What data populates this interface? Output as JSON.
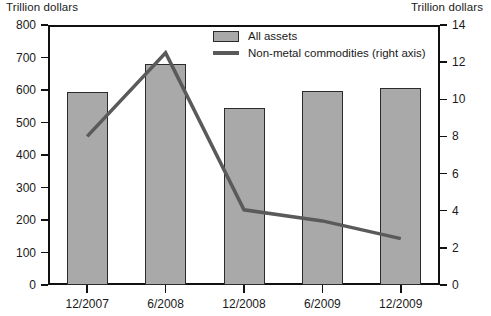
{
  "chart_data": {
    "type": "bar",
    "title": "",
    "subtitle": "",
    "categories": [
      "12/2007",
      "6/2008",
      "12/2008",
      "6/2009",
      "12/2009"
    ],
    "xlabel": "",
    "ylabel": "Trillion dollars",
    "ylabel_right": "Trillion dollars",
    "ylim": [
      0,
      800
    ],
    "ylim_right": [
      0,
      14
    ],
    "yticks": [
      0,
      100,
      200,
      300,
      400,
      500,
      600,
      700,
      800
    ],
    "yticks_right": [
      0,
      2,
      4,
      6,
      8,
      10,
      12,
      14
    ],
    "grid": false,
    "legend_position": "top-center",
    "series": [
      {
        "name": "All assets",
        "type": "bar",
        "axis": "left",
        "color": "#a9a9a9",
        "edge_color": "#2b2b2b",
        "values": [
          595,
          680,
          545,
          598,
          607
        ]
      },
      {
        "name": "Non-metal commodities (right axis)",
        "type": "line",
        "axis": "right",
        "color": "#5a5a5a",
        "values": [
          8.0,
          12.5,
          4.05,
          3.45,
          2.5
        ]
      }
    ]
  },
  "axis_captions": {
    "left": "Trillion dollars",
    "right": "Trillion dollars"
  },
  "legend": {
    "items": [
      {
        "label": "All assets",
        "marker": "filled-square-swatch"
      },
      {
        "label": "Non-metal commodities (right axis)",
        "marker": "line-swatch"
      }
    ]
  },
  "y_tick_labels_left": [
    "800",
    "700",
    "600",
    "500",
    "400",
    "300",
    "200",
    "100",
    "0"
  ],
  "y_tick_labels_right": [
    "14",
    "12",
    "10",
    "8",
    "6",
    "4",
    "2",
    "0"
  ],
  "x_tick_labels": [
    "12/2007",
    "6/2008",
    "12/2008",
    "6/2009",
    "12/2009"
  ],
  "colors": {
    "bar_fill": "#a9a9a9",
    "bar_edge": "#2b2b2b",
    "line": "#5a5a5a",
    "axis": "#111111",
    "background": "#ffffff"
  }
}
